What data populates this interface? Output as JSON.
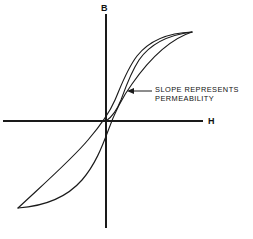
{
  "figure": {
    "background_color": "#ffffff",
    "ink_color": "#1a1a1a"
  },
  "axes": {
    "vertical": {
      "label": "B",
      "name": "magnetic-flux-density-axis",
      "x": 106,
      "y_top": 14,
      "y_bottom": 228
    },
    "horizontal": {
      "label": "H",
      "name": "magnetic-field-strength-axis",
      "y": 121,
      "x_left": 3,
      "x_right": 203
    },
    "label_positions": {
      "b_label_x": 101,
      "b_label_y": 11,
      "h_label_x": 208,
      "h_label_y": 124
    }
  },
  "annotation": {
    "line1": "SLOPE REPRESENTS",
    "line2": "PERMEABILITY",
    "text_x": 155,
    "line1_y": 92,
    "line2_y": 101,
    "leader_from_x": 152,
    "leader_to_x": 131,
    "leader_y": 91,
    "arrow_tip_x": 127,
    "arrow_tip_y": 91
  },
  "caption": {
    "text": ""
  },
  "chart_data": {
    "type": "line",
    "xlabel": "H",
    "ylabel": "B",
    "grid": false,
    "legend": false,
    "origin": [
      106,
      121
    ],
    "saturation_positive": [
      192,
      32
    ],
    "saturation_negative": [
      18,
      208
    ],
    "series": [
      {
        "name": "initial-magnetization-curve",
        "path": "M 106,121 C 112,117 117,110 121,100 C 125,89 130,74 139,60 C 150,44 168,35 192,32"
      },
      {
        "name": "descending-branch",
        "path": "M 192,32 C 166,33 148,42 137,56 C 127,69 121,86 115,100 C 109,114 100,126 88,140 C 72,159 48,180 18,208"
      },
      {
        "name": "ascending-branch",
        "path": "M 18,208 C 46,206 68,196 82,180 C 95,165 102,147 108,131 C 114,114 121,99 132,84 C 146,64 167,40 192,32"
      }
    ]
  }
}
